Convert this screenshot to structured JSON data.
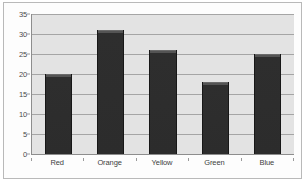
{
  "chart_data": {
    "type": "bar",
    "title": "",
    "subtitle": "",
    "xlabel": "",
    "ylabel": "",
    "categories": [
      "Red",
      "Orange",
      "Yellow",
      "Green",
      "Blue"
    ],
    "values": [
      20,
      31,
      26,
      18,
      25
    ],
    "ylim": [
      0,
      35
    ],
    "yticks": [
      0,
      5,
      10,
      15,
      20,
      25,
      30,
      35
    ],
    "ytick_labels": [
      "0",
      "5",
      "10",
      "15",
      "20",
      "25",
      "30",
      "35"
    ],
    "grid": true,
    "grid_axis": "y",
    "legend": false,
    "legend_position": "none",
    "annotations": [],
    "series": [
      {
        "name": "",
        "values": [
          20,
          31,
          26,
          18,
          25
        ]
      }
    ]
  },
  "style": {
    "bar_color": "#2f2f2f",
    "bar_top_color": "#545454",
    "plot_background": "#e3e3e3",
    "gridline_color": "#a5a5a5",
    "axis_color": "#8d8d8d",
    "frame_color": "#b9b9b9",
    "page_background": "#ffffff",
    "tick_label_color": "#4a4a4a"
  }
}
